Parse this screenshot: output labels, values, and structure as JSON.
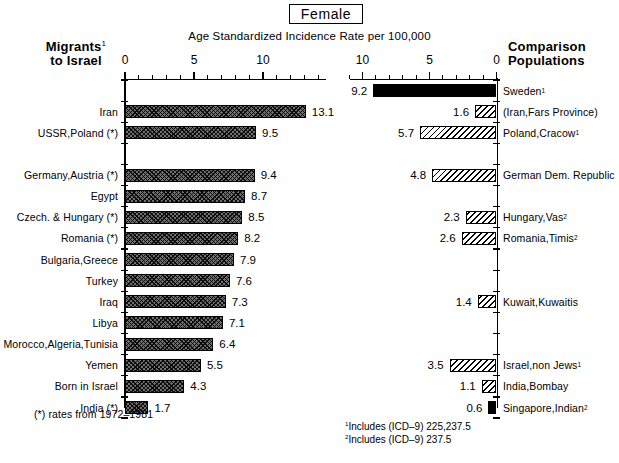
{
  "header": {
    "title": "Female",
    "subtitle": "Age Standardized Incidence Rate per 100,000",
    "left_panel_line1": "Migrants",
    "left_panel_sup": "1",
    "left_panel_line2": "to Israel",
    "right_panel_line1": "Comparison",
    "right_panel_line2": "Populations"
  },
  "axis": {
    "left_ticks": [
      "0",
      "5",
      "10"
    ],
    "right_ticks": [
      "10",
      "5",
      "0"
    ]
  },
  "notes": {
    "asterisk": "(*) rates from 1972–1981",
    "footnote1_marker": "1",
    "footnote1": "Includes (ICD–9) 225,237.5",
    "footnote2_marker": "2",
    "footnote2": "Includes (ICD–9) 237.5"
  },
  "chart_data": {
    "type": "bar",
    "title": "Female",
    "subtitle": "Age Standardized Incidence Rate per 100,000",
    "xlabel": "Age Standardized Incidence Rate per 100,000",
    "ylabel": "",
    "orientation": "horizontal",
    "layout": "mirrored two-panel (back-to-back) bar chart sharing 16 aligned row slots",
    "grid": false,
    "legend": "none",
    "panels": [
      {
        "name": "Migrants to Israel",
        "side": "left",
        "direction": "left-to-right",
        "xlim": [
          0,
          14.5
        ],
        "ticks_major": [
          0,
          5,
          10
        ],
        "tick_interval_minor": 1,
        "fill": "dark cross-hatch",
        "categories": [
          "",
          "Iran",
          "USSR,Poland (*)",
          "",
          "Germany,Austria (*)",
          "Egypt",
          "Czech. & Hungary (*)",
          "Romania (*)",
          "Bulgaria,Greece",
          "Turkey",
          "Iraq",
          "Libya",
          "Morocco,Algeria,Tunisia",
          "Yemen",
          "Born in Israel",
          "India (*)"
        ],
        "values": [
          null,
          13.1,
          9.5,
          null,
          9.4,
          8.7,
          8.5,
          8.2,
          7.9,
          7.6,
          7.3,
          7.1,
          6.4,
          5.5,
          4.3,
          1.7
        ]
      },
      {
        "name": "Comparison Populations",
        "side": "right",
        "direction": "right-to-left",
        "xlim": [
          0,
          11
        ],
        "ticks_major": [
          10,
          5,
          0
        ],
        "tick_interval_minor": 1,
        "fill": "light diagonal hatch (solid black for Sweden and Singapore,Indian)",
        "categories": [
          "Sweden",
          "(Iran,Fars Province)",
          "Poland,Cracow",
          "",
          "German Dem. Republic",
          "",
          "Hungary,Vas",
          "Romania,Timis",
          "",
          "",
          "Kuwait,Kuwaitis",
          "",
          "",
          "Israel,non Jews",
          "India,Bombay",
          "Singapore,Indian"
        ],
        "values": [
          9.2,
          1.6,
          5.7,
          null,
          4.8,
          null,
          2.3,
          2.6,
          null,
          null,
          1.4,
          null,
          null,
          3.5,
          1.1,
          0.6
        ],
        "category_superscripts": [
          "1",
          "",
          "1",
          "",
          "",
          "",
          "2",
          "2",
          "",
          "",
          "",
          "",
          "",
          "1",
          "",
          "2"
        ],
        "solid_rows": [
          0,
          15
        ]
      }
    ]
  }
}
